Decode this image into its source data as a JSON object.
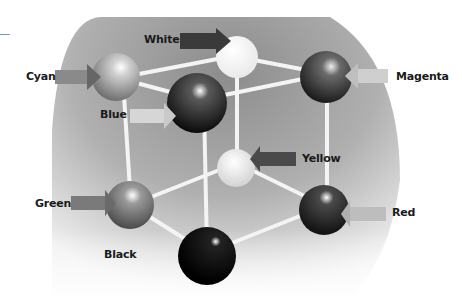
{
  "diagram": {
    "type": "color-cube",
    "vertices": [
      {
        "id": "white",
        "label": "White",
        "tone": "#f4f4f4"
      },
      {
        "id": "cyan",
        "label": "Cyan",
        "tone": "#a8a8a8"
      },
      {
        "id": "magenta",
        "label": "Magenta",
        "tone": "#3a3a3a"
      },
      {
        "id": "blue",
        "label": "Blue",
        "tone": "#1a1a1a"
      },
      {
        "id": "yellow",
        "label": "Yellow",
        "tone": "#d8d8d8"
      },
      {
        "id": "green",
        "label": "Green",
        "tone": "#7a7a7a"
      },
      {
        "id": "red",
        "label": "Red",
        "tone": "#2e2e2e"
      },
      {
        "id": "black",
        "label": "Black",
        "tone": "#050505"
      }
    ],
    "edges": [
      [
        "cyan",
        "white"
      ],
      [
        "white",
        "magenta"
      ],
      [
        "cyan",
        "blue"
      ],
      [
        "blue",
        "magenta"
      ],
      [
        "cyan",
        "green"
      ],
      [
        "blue",
        "black"
      ],
      [
        "white",
        "yellow"
      ],
      [
        "magenta",
        "red"
      ],
      [
        "green",
        "yellow"
      ],
      [
        "yellow",
        "red"
      ],
      [
        "green",
        "black"
      ],
      [
        "black",
        "red"
      ]
    ],
    "colors": {
      "backdrop": "#9a9a9a",
      "backdrop_light": "#e6e6e6",
      "arrow_dark": "#4a4a4a",
      "arrow_light": "#bdbdbd",
      "edge": "#f2f2f2",
      "accent_rule": "#6aa3b8"
    }
  }
}
